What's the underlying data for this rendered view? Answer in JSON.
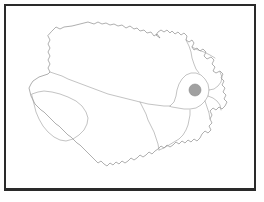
{
  "figure": {
    "panel_border_color": "#2a2a2a",
    "background_color": "#ffffff",
    "has_divider": true
  },
  "map": {
    "outline_color": "#8d8d8d",
    "subregion_color": "#9a9a9a",
    "fill_color": "#ffffff",
    "marker": {
      "label": "location-marker",
      "color": "#a0a0a0",
      "x": 193,
      "y": 88,
      "radius": 6
    }
  },
  "chart_data": {
    "type": "map",
    "title": "",
    "xlabel": "",
    "ylabel": "",
    "legend": [],
    "annotations": [
      {
        "name": "highlighted-locality",
        "type": "point-marker",
        "x": 193,
        "y": 88,
        "fill": "#a0a0a0"
      }
    ],
    "regions": [
      {
        "name": "northern-region",
        "style": "outline-only"
      },
      {
        "name": "western-region",
        "style": "outline-only"
      },
      {
        "name": "southwestern-region",
        "style": "outline-only"
      },
      {
        "name": "central-region",
        "style": "outline-only"
      },
      {
        "name": "southeastern-region",
        "style": "outline-only"
      },
      {
        "name": "northeastern-region",
        "style": "outline-only"
      },
      {
        "name": "eastern-region",
        "style": "outline-only"
      }
    ]
  }
}
